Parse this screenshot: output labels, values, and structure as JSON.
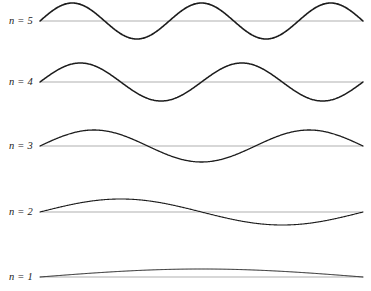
{
  "figure": {
    "title": "",
    "background_color": "#ffffff",
    "width": 371,
    "height": 291
  },
  "chart_data": {
    "type": "line",
    "title": "",
    "subtitle": "",
    "xlabel": "",
    "ylabel": "",
    "grid": false,
    "legend_position": "none",
    "axis_line_color": "#a6a6a6",
    "curve_color": "#1c1c1c",
    "x": [
      0,
      1
    ],
    "xlim": [
      0,
      1
    ],
    "ylim": [
      -1,
      1
    ],
    "series": [
      {
        "name": "n = 5",
        "label": "n = 5",
        "mode_number": 5,
        "half_wavelengths": 5,
        "formula": "y = A sin(5 pi x / L)",
        "amplitude_px": 18,
        "baseline_y_px": 21,
        "label_y_px": 21,
        "stroke_width_px": 1.6,
        "x_start_px": 40,
        "x_end_px": 363
      },
      {
        "name": "n = 4",
        "label": "n = 4",
        "mode_number": 4,
        "half_wavelengths": 4,
        "formula": "y = A sin(4 pi x / L)",
        "amplitude_px": 19,
        "baseline_y_px": 82,
        "label_y_px": 82,
        "stroke_width_px": 1.5,
        "x_start_px": 40,
        "x_end_px": 363
      },
      {
        "name": "n = 3",
        "label": "n = 3",
        "mode_number": 3,
        "half_wavelengths": 3,
        "formula": "y = A sin(3 pi x / L)",
        "amplitude_px": 16,
        "baseline_y_px": 146,
        "label_y_px": 146,
        "stroke_width_px": 1.3,
        "x_start_px": 40,
        "x_end_px": 363
      },
      {
        "name": "n = 2",
        "label": "n = 2",
        "mode_number": 2,
        "half_wavelengths": 2,
        "formula": "y = A sin(2 pi x / L)",
        "amplitude_px": 13,
        "baseline_y_px": 212,
        "label_y_px": 212,
        "stroke_width_px": 1.1,
        "x_start_px": 40,
        "x_end_px": 363
      },
      {
        "name": "n = 1",
        "label": "n = 1",
        "mode_number": 1,
        "half_wavelengths": 1,
        "formula": "y = A sin(pi x / L)",
        "amplitude_px": 8,
        "baseline_y_px": 277,
        "label_y_px": 277,
        "stroke_width_px": 1.0,
        "x_start_px": 40,
        "x_end_px": 363
      }
    ]
  },
  "labels": {
    "n5": "n = 5",
    "n4": "n = 4",
    "n3": "n = 3",
    "n2": "n = 2",
    "n1": "n = 1"
  }
}
